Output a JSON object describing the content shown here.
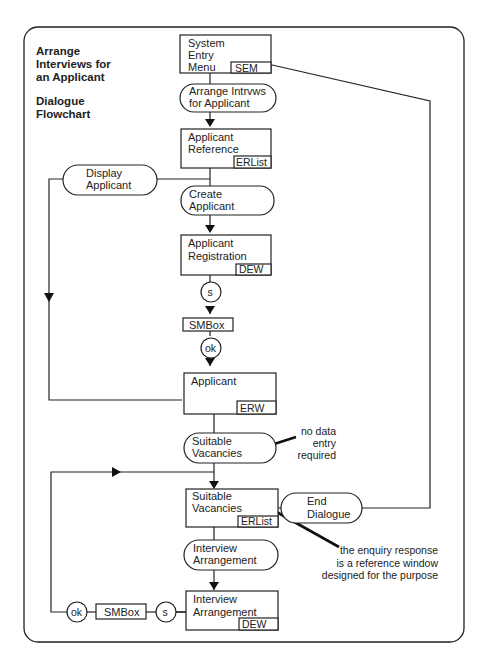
{
  "title": {
    "line1": "Arrange",
    "line2": "Interviews for",
    "line3": "an Applicant",
    "subtitle1": "Dialogue",
    "subtitle2": "Flowchart"
  },
  "windows": {
    "system_entry_menu": {
      "line1": "System",
      "line2": "Entry",
      "line3": "Menu",
      "tag": "SEM"
    },
    "applicant_reference": {
      "line1": "Applicant",
      "line2": "Reference",
      "tag": "ERList"
    },
    "applicant_registration": {
      "line1": "Applicant",
      "line2": "Registration",
      "tag": "DEW"
    },
    "smbox_1": {
      "label": "SMBox"
    },
    "applicant": {
      "line1": "Applicant",
      "tag": "ERW"
    },
    "suitable_vacancies": {
      "line1": "Suitable",
      "line2": "Vacancies",
      "tag": "ERList"
    },
    "interview_arrangement": {
      "line1": "Interview",
      "line2": "Arrangement",
      "tag": "DEW"
    },
    "smbox_2": {
      "label": "SMBox"
    }
  },
  "actions": {
    "arrange_intrvws": {
      "line1": "Arrange Intrvws",
      "line2": "for Applicant"
    },
    "display_applicant": {
      "line1": "Display",
      "line2": "Applicant"
    },
    "create_applicant": {
      "line1": "Create",
      "line2": "Applicant"
    },
    "suitable_vacancies": {
      "line1": "Suitable",
      "line2": "Vacancies"
    },
    "end_dialogue": {
      "line1": "End",
      "line2": "Dialogue"
    },
    "interview_arrangement": {
      "line1": "Interview",
      "line2": "Arrangement"
    }
  },
  "connectors": {
    "s1": "s",
    "ok1": "ok",
    "s2": "s",
    "ok2": "ok"
  },
  "notes": {
    "no_data": {
      "line1": "no data",
      "line2": "entry",
      "line3": "required"
    },
    "enquiry": {
      "line1": "the enquiry response",
      "line2": "is a reference window",
      "line3": "designed for the purpose"
    }
  }
}
